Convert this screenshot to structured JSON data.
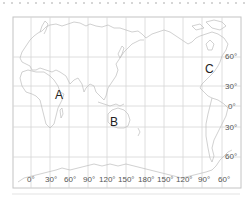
{
  "map": {
    "frame": {
      "left": 13,
      "top": 17,
      "right": 241,
      "bottom": 188
    },
    "grid_color": "#cfcfcf",
    "coast_color": "#b9b9b9",
    "longitude_labels": [
      "0°",
      "30°",
      "60°",
      "90°",
      "120°",
      "150°",
      "180°",
      "150°",
      "120°",
      "90°",
      "60°"
    ],
    "latitude_labels": [
      "60°",
      "30°",
      "0°",
      "30°",
      "60°"
    ],
    "points": [
      {
        "id": "A",
        "label": "A"
      },
      {
        "id": "B",
        "label": "B"
      },
      {
        "id": "C",
        "label": "C"
      }
    ]
  }
}
